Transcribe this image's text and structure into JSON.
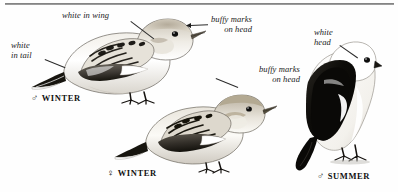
{
  "plate": {
    "subject": "Snow Bunting plumages",
    "background_color": "#fefefe",
    "rule_color": "#6e6e6e"
  },
  "annotations": [
    {
      "id": "white-in-wing",
      "text": "white in wing",
      "lines": [
        "white in wing"
      ]
    },
    {
      "id": "white-in-tail",
      "text": "white in tail",
      "lines": [
        "white",
        "in tail"
      ]
    },
    {
      "id": "buffy-marks-head-male",
      "text": "buffy marks on head",
      "lines": [
        "buffy marks",
        "on head"
      ]
    },
    {
      "id": "buffy-marks-head-female",
      "text": "buffy marks on head",
      "lines": [
        "buffy marks",
        "on head"
      ]
    },
    {
      "id": "white-head",
      "text": "white head",
      "lines": [
        "white",
        "head"
      ]
    }
  ],
  "ann_text": {
    "white_in_wing": "white in wing",
    "white_tail_l1": "white",
    "white_tail_l2": "in tail",
    "buffy_male_l1": "buffy marks",
    "buffy_male_l2": "on head",
    "buffy_female_l1": "buffy marks",
    "buffy_female_l2": "on head",
    "white_head_l1": "white",
    "white_head_l2": "head"
  },
  "captions": [
    {
      "id": "male-winter",
      "symbol": "♂",
      "label": "WINTER",
      "sex": "male"
    },
    {
      "id": "female-winter",
      "symbol": "♀",
      "label": "WINTER",
      "sex": "female"
    },
    {
      "id": "male-summer",
      "symbol": "♂",
      "label": "SUMMER",
      "sex": "male"
    }
  ],
  "caption_text": {
    "male_winter_symbol": "♂",
    "male_winter_label": "WINTER",
    "female_winter_symbol": "♀",
    "female_winter_label": "WINTER",
    "male_summer_symbol": "♂",
    "male_summer_label": "SUMMER"
  },
  "birds": [
    {
      "id": "bird-male-winter",
      "name": "male winter snow bunting",
      "plumage": "pale buff head, white underparts, mottled dark-and-white wing, black-and-white tail"
    },
    {
      "id": "bird-female-winter",
      "name": "female winter snow bunting",
      "plumage": "buffy head markings, streaked brown back, dark wing with white patch"
    },
    {
      "id": "bird-male-summer",
      "name": "male summer snow bunting",
      "plumage": "pure white head and underparts, solid black back, wings and tail"
    }
  ],
  "colors": {
    "ink": "#1a1a1a",
    "black": "#111111",
    "mid_gray": "#8a8a8a",
    "light_gray": "#d8d8d8",
    "buff": "#cfc6b4",
    "white": "#ffffff"
  }
}
